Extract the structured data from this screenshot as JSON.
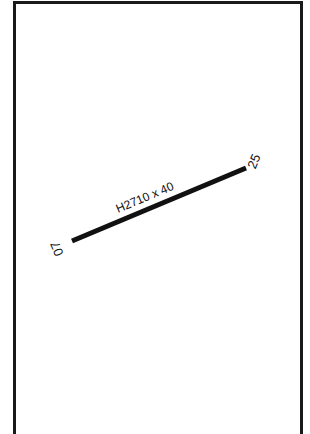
{
  "diagram": {
    "type": "airport-runway-diagram",
    "colors": {
      "frame": "#1a1a1a",
      "runway": "#111111",
      "text": "#111111",
      "background": "#ffffff"
    },
    "runway": {
      "designation_label": "H2710 x 40",
      "start": {
        "x": 72,
        "y": 241
      },
      "end": {
        "x": 246,
        "y": 168
      },
      "ends": [
        {
          "id": "07",
          "label": "07"
        },
        {
          "id": "25",
          "label": "25"
        }
      ]
    }
  }
}
